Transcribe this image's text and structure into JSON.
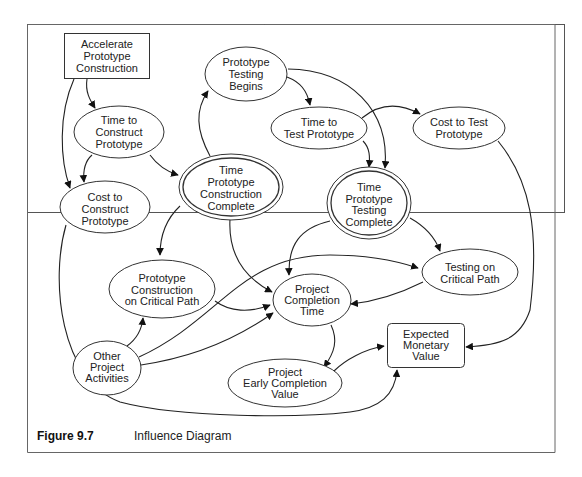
{
  "figure": {
    "label": "Figure 9.7",
    "title": "Influence Diagram"
  },
  "nodes": [
    {
      "id": "accelerate",
      "type": "decision",
      "lines": [
        "Accelerate",
        "Prototype",
        "Construction"
      ]
    },
    {
      "id": "time_construct",
      "type": "chance",
      "lines": [
        "Time to",
        "Construct",
        "Prototype"
      ]
    },
    {
      "id": "cost_construct",
      "type": "chance",
      "lines": [
        "Cost to",
        "Construct",
        "Prototype"
      ]
    },
    {
      "id": "testing_begins",
      "type": "chance",
      "lines": [
        "Prototype",
        "Testing",
        "Begins"
      ]
    },
    {
      "id": "time_constr_complete",
      "type": "deterministic",
      "lines": [
        "Time",
        "Prototype",
        "Construction",
        "Complete"
      ]
    },
    {
      "id": "time_test",
      "type": "chance",
      "lines": [
        "Time to",
        "Test Prototype"
      ]
    },
    {
      "id": "cost_test",
      "type": "chance",
      "lines": [
        "Cost to Test",
        "Prototype"
      ]
    },
    {
      "id": "time_test_complete",
      "type": "deterministic",
      "lines": [
        "Time",
        "Prototype",
        "Testing",
        "Complete"
      ]
    },
    {
      "id": "constr_critical",
      "type": "chance",
      "lines": [
        "Prototype",
        "Construction",
        "on Critical Path"
      ]
    },
    {
      "id": "completion_time",
      "type": "chance",
      "lines": [
        "Project",
        "Completion",
        "Time"
      ]
    },
    {
      "id": "testing_critical",
      "type": "chance",
      "lines": [
        "Testing on",
        "Critical Path"
      ]
    },
    {
      "id": "other_activities",
      "type": "chance",
      "lines": [
        "Other",
        "Project",
        "Activities"
      ]
    },
    {
      "id": "expected_value",
      "type": "value",
      "lines": [
        "Expected",
        "Monetary",
        "Value"
      ]
    },
    {
      "id": "early_value",
      "type": "chance",
      "lines": [
        "Project",
        "Early Completion",
        "Value"
      ]
    }
  ],
  "edges": [
    [
      "accelerate",
      "time_construct"
    ],
    [
      "accelerate",
      "cost_construct"
    ],
    [
      "time_construct",
      "cost_construct"
    ],
    [
      "time_construct",
      "time_constr_complete"
    ],
    [
      "time_constr_complete",
      "testing_begins"
    ],
    [
      "testing_begins",
      "time_test"
    ],
    [
      "testing_begins",
      "time_test_complete"
    ],
    [
      "time_test",
      "time_test_complete"
    ],
    [
      "time_test",
      "cost_test"
    ],
    [
      "time_constr_complete",
      "constr_critical"
    ],
    [
      "time_constr_complete",
      "completion_time"
    ],
    [
      "time_test_complete",
      "completion_time"
    ],
    [
      "time_test_complete",
      "testing_critical"
    ],
    [
      "constr_critical",
      "completion_time"
    ],
    [
      "testing_critical",
      "completion_time"
    ],
    [
      "other_activities",
      "constr_critical"
    ],
    [
      "other_activities",
      "completion_time"
    ],
    [
      "other_activities",
      "testing_critical"
    ],
    [
      "completion_time",
      "early_value"
    ],
    [
      "early_value",
      "expected_value"
    ],
    [
      "cost_test",
      "expected_value"
    ],
    [
      "cost_construct",
      "expected_value"
    ]
  ]
}
